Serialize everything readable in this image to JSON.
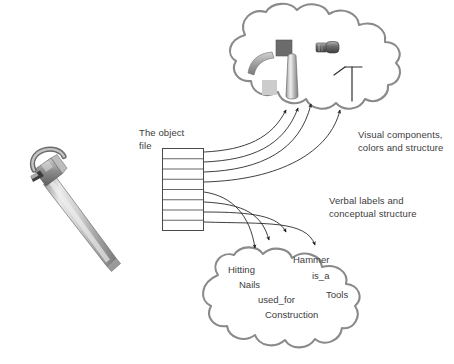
{
  "figure": {
    "background_color": "#ffffff",
    "text_color": "#3d3d3d",
    "cloud_stroke_color": "#8a8a8a",
    "arrow_color": "#222222",
    "grid_stroke_color": "#555555"
  },
  "photo": {
    "name": "claw-hammer-photograph",
    "alt": "Photograph of a claw hammer angled diagonally",
    "metal_light": "#e6e6e6",
    "metal_mid": "#b8b8b8",
    "metal_dark": "#7d7d7d",
    "metal_darkest": "#4a4a4a"
  },
  "object_file": {
    "label": "The object\nfile",
    "label_lines": [
      "The object",
      "file"
    ],
    "row_count": 8
  },
  "top_cloud": {
    "name": "visual-components-cloud",
    "caption": "Visual components,\ncolors and structure",
    "caption_lines": [
      "Visual components,",
      "colors and structure"
    ],
    "arrow_count": 4,
    "elements": [
      {
        "name": "claw-curve-shape",
        "type": "curve",
        "color": "#9a9a9a"
      },
      {
        "name": "dark-gray-square",
        "type": "square",
        "color": "#6b6b6b"
      },
      {
        "name": "light-gray-square",
        "type": "square",
        "color": "#cccccc"
      },
      {
        "name": "handle-cylinder",
        "type": "cylinder",
        "color": "#a8a8a8"
      },
      {
        "name": "hammer-head-small",
        "type": "head",
        "color": "#5a5a5a"
      },
      {
        "name": "hammer-outline-tee",
        "type": "outline",
        "color": "#333333"
      }
    ]
  },
  "bottom_cloud": {
    "name": "conceptual-structure-cloud",
    "caption": "Verbal labels and\nconceptual structure",
    "caption_lines": [
      "Verbal labels and",
      "conceptual structure"
    ],
    "arrow_count": 4,
    "concepts": [
      {
        "id": "hitting",
        "text": "Hitting"
      },
      {
        "id": "nails",
        "text": "Nails"
      },
      {
        "id": "used_for",
        "text": "used_for"
      },
      {
        "id": "construction",
        "text": "Construction"
      },
      {
        "id": "hammer",
        "text": "Hammer"
      },
      {
        "id": "is_a",
        "text": "is_a"
      },
      {
        "id": "tools",
        "text": "Tools"
      }
    ]
  }
}
